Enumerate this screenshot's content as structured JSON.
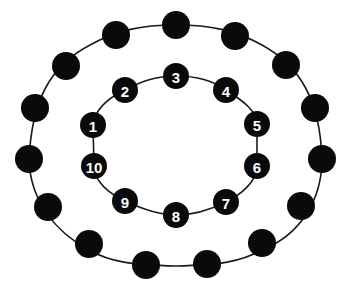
{
  "diagram": {
    "title": "",
    "colors": {
      "bead": "#0a0a0a",
      "line": "#1a1a1a",
      "label": "#ffffff",
      "background": "#ffffff"
    },
    "outer_ring": {
      "bead_count": 14,
      "bead_radius": 14,
      "path": "M176,25 C210,25 235,30 262,45 C300,66 320,100 322,159 C322,200 300,235 262,250 C240,262 220,265 176,266 C132,265 110,262 89,250 C55,232 30,200 29,159 C32,100 50,66 90,45 C117,30 142,25 176,25 Z",
      "beads": [
        {
          "x": 176,
          "y": 25,
          "label": ""
        },
        {
          "x": 235,
          "y": 36,
          "label": ""
        },
        {
          "x": 286,
          "y": 65,
          "label": ""
        },
        {
          "x": 315,
          "y": 108,
          "label": ""
        },
        {
          "x": 322,
          "y": 159,
          "label": ""
        },
        {
          "x": 301,
          "y": 206,
          "label": ""
        },
        {
          "x": 262,
          "y": 243,
          "label": ""
        },
        {
          "x": 207,
          "y": 264,
          "label": ""
        },
        {
          "x": 146,
          "y": 265,
          "label": ""
        },
        {
          "x": 89,
          "y": 244,
          "label": ""
        },
        {
          "x": 48,
          "y": 207,
          "label": ""
        },
        {
          "x": 29,
          "y": 159,
          "label": ""
        },
        {
          "x": 35,
          "y": 108,
          "label": ""
        },
        {
          "x": 66,
          "y": 66,
          "label": ""
        },
        {
          "x": 116,
          "y": 35,
          "label": ""
        }
      ]
    },
    "inner_ring": {
      "bead_count": 10,
      "bead_radius": 13,
      "path": "M176,76 C200,76 215,82 226,90 C245,102 257,112 257,124 L257,166 C257,182 240,195 226,202 C210,210 195,215 176,215 C157,215 140,208 125,201 C110,194 94,182 94,166 L93,125 C95,110 108,98 125,90 C140,82 155,76 176,76 Z",
      "beads": [
        {
          "x": 93,
          "y": 125,
          "label": "1"
        },
        {
          "x": 125,
          "y": 90,
          "label": "2"
        },
        {
          "x": 176,
          "y": 76,
          "label": "3"
        },
        {
          "x": 226,
          "y": 90,
          "label": "4"
        },
        {
          "x": 257,
          "y": 124,
          "label": "5"
        },
        {
          "x": 257,
          "y": 166,
          "label": "6"
        },
        {
          "x": 226,
          "y": 202,
          "label": "7"
        },
        {
          "x": 176,
          "y": 215,
          "label": "8"
        },
        {
          "x": 125,
          "y": 201,
          "label": "9"
        },
        {
          "x": 94,
          "y": 166,
          "label": "10"
        }
      ]
    }
  }
}
